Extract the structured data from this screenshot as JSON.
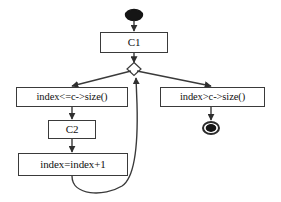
{
  "diagram": {
    "type": "flowchart",
    "background_color": "#ffffff",
    "line_color": "#3a3a3a",
    "node_fill": "#ffffff",
    "text_color": "#111111",
    "nodes": {
      "start": {
        "label": "",
        "shape": "filled-ellipse",
        "name": "start-node"
      },
      "c1": {
        "label": "C1",
        "shape": "rectangle"
      },
      "branch": {
        "label": "",
        "shape": "diamond"
      },
      "cond_true": {
        "label": "index<=c->size()",
        "shape": "rectangle"
      },
      "cond_false": {
        "label": "index>c->size()",
        "shape": "rectangle"
      },
      "c2": {
        "label": "C2",
        "shape": "rectangle"
      },
      "increment": {
        "label": "index=index+1",
        "shape": "rectangle"
      },
      "end": {
        "label": "",
        "shape": "bullseye",
        "name": "end-node"
      }
    },
    "edges": [
      {
        "from": "start",
        "to": "c1",
        "label": ""
      },
      {
        "from": "c1",
        "to": "branch",
        "label": ""
      },
      {
        "from": "branch",
        "to": "cond_true",
        "label": ""
      },
      {
        "from": "branch",
        "to": "cond_false",
        "label": ""
      },
      {
        "from": "cond_true",
        "to": "c2",
        "label": ""
      },
      {
        "from": "c2",
        "to": "increment",
        "label": ""
      },
      {
        "from": "increment",
        "to": "branch",
        "label": ""
      },
      {
        "from": "cond_false",
        "to": "end",
        "label": ""
      }
    ]
  }
}
